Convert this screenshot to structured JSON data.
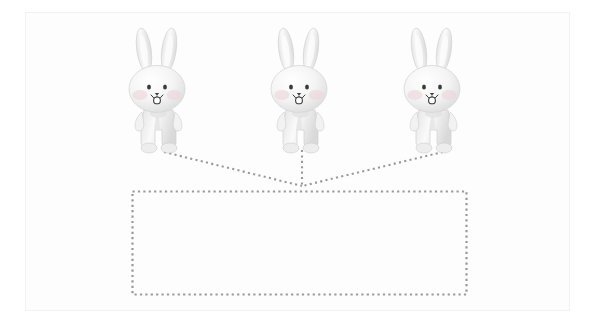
{
  "canvas": {
    "width": 595,
    "height": 333,
    "background_color": "#ffffff",
    "panel_background_color": "#fdfdfd",
    "frame_border_color": "#f2f2f2"
  },
  "diagram": {
    "type": "convergence-diagram",
    "dot_color": "#9a9a9a",
    "figure_count": 3
  },
  "figures": [
    {
      "id": "rabbit-left",
      "label": "white rabbit figurine",
      "x": 160,
      "y": 91,
      "body_color": "#f3f3f3",
      "shadow_color": "#d8d8d8",
      "cheek_color": "#ecd7d7",
      "face_color": "#3a3a3a"
    },
    {
      "id": "rabbit-center",
      "label": "white rabbit figurine",
      "x": 302,
      "y": 91,
      "body_color": "#f3f3f3",
      "shadow_color": "#d8d8d8",
      "cheek_color": "#ecd7d7",
      "face_color": "#3a3a3a"
    },
    {
      "id": "rabbit-right",
      "label": "white rabbit figurine",
      "x": 435,
      "y": 91,
      "body_color": "#f3f3f3",
      "shadow_color": "#d8d8d8",
      "cheek_color": "#ecd7d7",
      "face_color": "#3a3a3a"
    }
  ],
  "connectors": [
    {
      "id": "connector-left",
      "from_x": 164,
      "from_y": 152,
      "to_x": 302,
      "to_y": 186,
      "style": "dotted"
    },
    {
      "id": "connector-center",
      "from_x": 302,
      "from_y": 150,
      "to_x": 302,
      "to_y": 186,
      "style": "dotted"
    },
    {
      "id": "connector-right",
      "from_x": 443,
      "from_y": 152,
      "to_x": 302,
      "to_y": 186,
      "style": "dotted"
    }
  ],
  "convergence_point": {
    "x": 302,
    "y": 186
  },
  "region_box": {
    "id": "dotted-region",
    "x": 132,
    "y": 191,
    "width": 335,
    "height": 104,
    "style": "dotted",
    "fill": "none",
    "border_color": "#9a9a9a",
    "content": ""
  }
}
